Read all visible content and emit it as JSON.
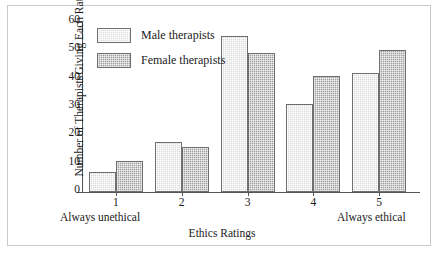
{
  "chart_data": {
    "type": "bar",
    "title": "",
    "xlabel": "Ethics Ratings",
    "ylabel_line1": "Number of Therapists",
    "ylabel_line2": "Giving Each Rating",
    "categories": [
      "1",
      "2",
      "3",
      "4",
      "5"
    ],
    "series": [
      {
        "name": "Male therapists",
        "values": [
          7,
          17.5,
          55,
          31,
          42
        ],
        "color": "#d9d9d9"
      },
      {
        "name": "Female therapists",
        "values": [
          11,
          16,
          49,
          41,
          50
        ],
        "color": "#a0a0a0"
      }
    ],
    "ylim": [
      0,
      60
    ],
    "yticks": [
      0,
      10,
      20,
      30,
      40,
      50,
      60
    ],
    "ytick_labels": [
      "0",
      "10",
      "20",
      "30",
      "40",
      "50",
      "60"
    ],
    "grid": false,
    "legend_position": "top-left-inside",
    "annotations": {
      "x_left_anchor": "Always unethical",
      "x_right_anchor": "Always ethical"
    }
  },
  "legend": {
    "entries": [
      {
        "label": "Male therapists"
      },
      {
        "label": "Female therapists"
      }
    ]
  }
}
